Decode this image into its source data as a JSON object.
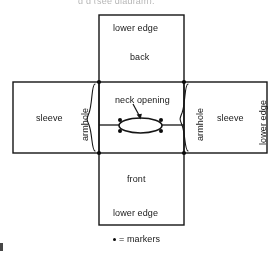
{
  "page": {
    "clipped_header_text": "                          g                    g  (see diagram).",
    "background_color": "#ffffff",
    "ink_color": "#1a1a1a"
  },
  "diagram": {
    "name": "garment-construction-diagram",
    "labels": {
      "back_lower_edge": "lower edge",
      "back": "back",
      "neck_opening": "neck opening",
      "front": "front",
      "front_lower_edge": "lower edge",
      "left_sleeve": "sleeve",
      "left_armhole": "armhole",
      "right_sleeve": "sleeve",
      "right_armhole": "armhole",
      "right_lower_edge": "lower edge"
    },
    "legend": {
      "symbol": "marker-dot",
      "equals": "=",
      "text": "markers"
    },
    "markers": [
      {
        "name": "left-shoulder-marker",
        "x": 99,
        "y": 82
      },
      {
        "name": "right-shoulder-marker",
        "x": 184,
        "y": 82
      },
      {
        "name": "left-underarm-marker",
        "x": 99,
        "y": 153
      },
      {
        "name": "right-underarm-marker",
        "x": 184,
        "y": 153
      },
      {
        "name": "neck-left-top-marker",
        "x": 119,
        "y": 120
      },
      {
        "name": "neck-right-top-marker",
        "x": 162,
        "y": 120
      },
      {
        "name": "neck-left-bottom-marker",
        "x": 119,
        "y": 131
      },
      {
        "name": "neck-right-bottom-marker",
        "x": 162,
        "y": 131
      }
    ]
  }
}
